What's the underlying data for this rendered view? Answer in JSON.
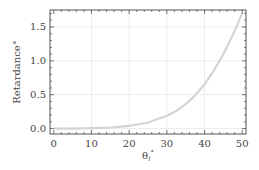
{
  "chart_data": {
    "type": "line",
    "title": "",
    "xlabel": "θi°",
    "xlabel_main": "θ",
    "xlabel_sub": "i",
    "xlabel_sup": "°",
    "ylabel": "Retardance°",
    "xlim": [
      -1,
      51
    ],
    "ylim": [
      -0.08,
      1.75
    ],
    "xticks": [
      0,
      10,
      20,
      30,
      40,
      50
    ],
    "xtick_labels": [
      "0",
      "10",
      "20",
      "30",
      "40",
      "50"
    ],
    "yticks": [
      0.0,
      0.5,
      1.0,
      1.5
    ],
    "ytick_labels": [
      "0.0",
      "0.5",
      "1.0",
      "1.5"
    ],
    "grid": true,
    "legend": null,
    "series": [
      {
        "name": "Retardance",
        "color": "#d4d4d4",
        "x": [
          0,
          5,
          10,
          15,
          20,
          25,
          30,
          32.5,
          35,
          37.5,
          40,
          42.5,
          45,
          47.5,
          50
        ],
        "values": [
          0.0,
          0.0,
          0.005,
          0.015,
          0.04,
          0.09,
          0.19,
          0.26,
          0.36,
          0.49,
          0.65,
          0.86,
          1.1,
          1.38,
          1.7
        ]
      }
    ]
  },
  "colors": {
    "frame": "#555555",
    "grid": "#ececec",
    "curve": "#d4d4d4",
    "text": "#444444"
  }
}
